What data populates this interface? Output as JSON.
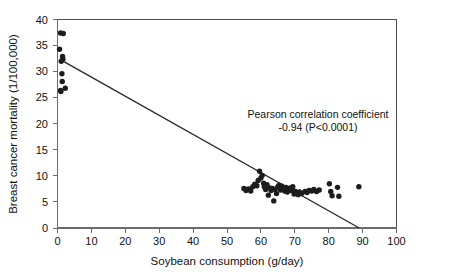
{
  "figure": {
    "background_color": "#ffffff",
    "point_color": "#1c1c1c",
    "line_color": "#2b2b2b",
    "axis_color": "#6b6b6b"
  },
  "annotation": {
    "line1": "Pearson correlation coefficient",
    "line2": "-0.94 (P<0.0001)"
  },
  "axes": {
    "x_title": "Soybean consumption (g/day)",
    "y_title": "Breast cancer mortality (1/100,000)",
    "x_ticks": [
      "0",
      "10",
      "20",
      "30",
      "40",
      "50",
      "60",
      "70",
      "80",
      "90",
      "100"
    ],
    "y_ticks": [
      "0",
      "5",
      "10",
      "15",
      "20",
      "25",
      "30",
      "35",
      "40"
    ]
  },
  "chart_data": {
    "type": "scatter",
    "title": "",
    "xlabel": "Soybean consumption (g/day)",
    "ylabel": "Breast cancer mortality (1/100,000)",
    "xlim": [
      0,
      100
    ],
    "ylim": [
      0,
      40
    ],
    "xticks": [
      0,
      10,
      20,
      30,
      40,
      50,
      60,
      70,
      80,
      90,
      100
    ],
    "yticks": [
      0,
      5,
      10,
      15,
      20,
      25,
      30,
      35,
      40
    ],
    "grid": false,
    "legend": "none",
    "annotations": [
      {
        "text": "Pearson correlation coefficient\n-0.94 (P<0.0001)",
        "x": 72,
        "y": 21.5
      }
    ],
    "series": [
      {
        "name": "Countries",
        "marker": "filled-circle",
        "color": "#1c1c1c",
        "points": [
          [
            0.9,
            37.4
          ],
          [
            1.7,
            37.3
          ],
          [
            0.6,
            34.3
          ],
          [
            1.5,
            32.9
          ],
          [
            1.6,
            32.4
          ],
          [
            1.1,
            32.0
          ],
          [
            1.3,
            29.6
          ],
          [
            1.4,
            28.1
          ],
          [
            0.9,
            26.4
          ],
          [
            1.0,
            26.2
          ],
          [
            2.3,
            26.8
          ],
          [
            55.0,
            7.6
          ],
          [
            55.6,
            7.2
          ],
          [
            56.3,
            7.5
          ],
          [
            57.0,
            7.1
          ],
          [
            57.6,
            7.9
          ],
          [
            58.2,
            8.4
          ],
          [
            58.8,
            8.1
          ],
          [
            59.2,
            9.1
          ],
          [
            59.6,
            10.9
          ],
          [
            60.0,
            9.6
          ],
          [
            60.4,
            10.1
          ],
          [
            60.8,
            8.6
          ],
          [
            61.0,
            7.9
          ],
          [
            61.4,
            7.4
          ],
          [
            61.8,
            8.3
          ],
          [
            62.2,
            6.3
          ],
          [
            62.6,
            7.7
          ],
          [
            63.0,
            7.2
          ],
          [
            63.4,
            7.6
          ],
          [
            63.8,
            5.2
          ],
          [
            64.2,
            7.4
          ],
          [
            64.6,
            6.6
          ],
          [
            65.0,
            7.9
          ],
          [
            65.4,
            8.2
          ],
          [
            65.8,
            7.3
          ],
          [
            66.2,
            8.0
          ],
          [
            66.6,
            7.5
          ],
          [
            67.0,
            7.1
          ],
          [
            67.4,
            7.8
          ],
          [
            67.8,
            6.9
          ],
          [
            68.2,
            7.4
          ],
          [
            68.6,
            7.7
          ],
          [
            69.0,
            7.2
          ],
          [
            69.4,
            7.9
          ],
          [
            69.8,
            6.5
          ],
          [
            70.2,
            7.0
          ],
          [
            70.6,
            6.7
          ],
          [
            71.0,
            6.4
          ],
          [
            71.4,
            6.9
          ],
          [
            72.0,
            6.6
          ],
          [
            73.0,
            7.0
          ],
          [
            73.6,
            6.8
          ],
          [
            74.2,
            7.2
          ],
          [
            75.0,
            7.1
          ],
          [
            75.6,
            7.4
          ],
          [
            76.4,
            7.0
          ],
          [
            77.2,
            7.3
          ],
          [
            80.2,
            8.5
          ],
          [
            80.6,
            7.0
          ],
          [
            81.0,
            6.2
          ],
          [
            82.6,
            7.8
          ],
          [
            83.0,
            6.1
          ],
          [
            88.9,
            7.9
          ]
        ]
      }
    ],
    "trendline": {
      "type": "linear",
      "x_start": 1.1,
      "y_start": 32.2,
      "x_end": 89.0,
      "y_end": 0.0,
      "slope": -0.366,
      "intercept": 32.6
    }
  }
}
